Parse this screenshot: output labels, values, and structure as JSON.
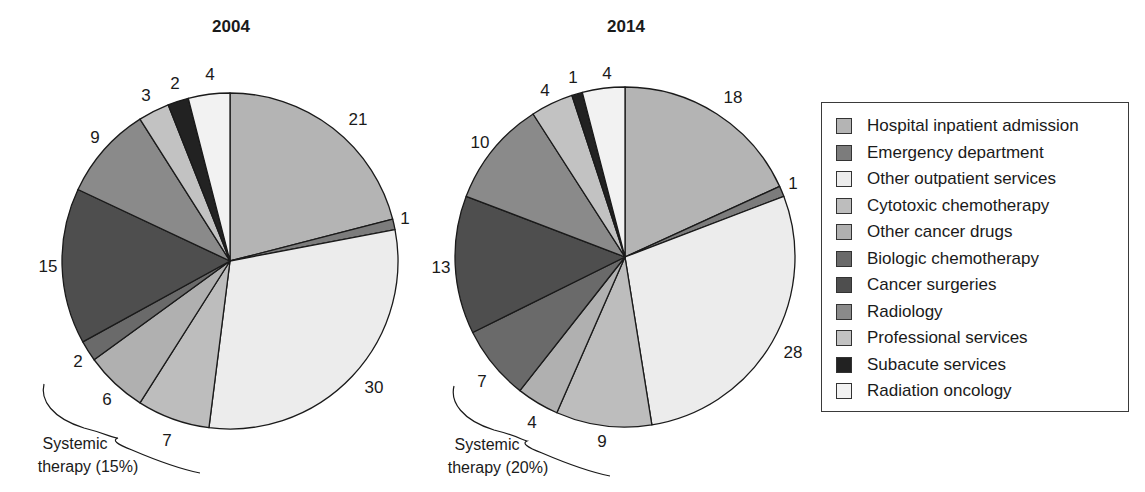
{
  "chart_data": {
    "type": "pie",
    "unit": "%",
    "categories": [
      "Hospital inpatient admission",
      "Emergency department",
      "Other outpatient services",
      "Cytotoxic chemotherapy",
      "Other cancer drugs",
      "Biologic chemotherapy",
      "Cancer surgeries",
      "Radiology",
      "Professional services",
      "Subacute services",
      "Radiation oncology"
    ],
    "colors": [
      "#b4b4b4",
      "#7c7c7c",
      "#ececec",
      "#bdbdbd",
      "#b0b0b0",
      "#6a6a6a",
      "#4e4e4e",
      "#8a8a8a",
      "#c2c2c2",
      "#222222",
      "#f2f2f2"
    ],
    "series": [
      {
        "name": "2004",
        "title": "2004",
        "values": [
          21,
          1,
          30,
          7,
          6,
          2,
          15,
          9,
          3,
          2,
          4
        ],
        "annotation": "Systemic therapy (15%)",
        "annotation_lines": [
          "Systemic",
          "therapy (15%)"
        ],
        "annotation_covers": [
          "Cytotoxic chemotherapy",
          "Other cancer drugs",
          "Biologic chemotherapy"
        ]
      },
      {
        "name": "2014",
        "title": "2014",
        "values": [
          18,
          1,
          28,
          9,
          4,
          7,
          13,
          10,
          4,
          1,
          4
        ],
        "annotation": "Systemic therapy (20%)",
        "annotation_lines": [
          "Systemic",
          "therapy (20%)"
        ],
        "annotation_covers": [
          "Cytotoxic chemotherapy",
          "Other cancer drugs",
          "Biologic chemotherapy"
        ]
      }
    ],
    "start_angle": "12 o'clock",
    "direction": "clockwise",
    "legend_position": "right"
  },
  "pies": [
    {
      "title": "2004",
      "cx": 230,
      "cy": 261,
      "r": 168,
      "title_pos": [
        231,
        32
      ],
      "labels": [
        {
          "text": "21",
          "x": 358,
          "y": 125
        },
        {
          "text": "1",
          "x": 405,
          "y": 224
        },
        {
          "text": "30",
          "x": 374,
          "y": 393
        },
        {
          "text": "7",
          "x": 167,
          "y": 446
        },
        {
          "text": "6",
          "x": 107,
          "y": 405
        },
        {
          "text": "2",
          "x": 78,
          "y": 367
        },
        {
          "text": "15",
          "x": 48,
          "y": 272
        },
        {
          "text": "9",
          "x": 95,
          "y": 143
        },
        {
          "text": "3",
          "x": 146,
          "y": 101
        },
        {
          "text": "2",
          "x": 175,
          "y": 89
        },
        {
          "text": "4",
          "x": 210,
          "y": 80
        }
      ],
      "brace": "M44,384 C40,400 52,418 84,428 C108,434 112,438 118,438 C112,440 116,444 132,450 C160,462 185,470 200,473",
      "annot_pos": [
        [
          75,
          449
        ],
        [
          88,
          472
        ]
      ]
    },
    {
      "title": "2014",
      "cx": 625,
      "cy": 257,
      "r": 170,
      "title_pos": [
        626,
        32
      ],
      "labels": [
        {
          "text": "18",
          "x": 733,
          "y": 103
        },
        {
          "text": "1",
          "x": 793,
          "y": 189
        },
        {
          "text": "28",
          "x": 793,
          "y": 358
        },
        {
          "text": "9",
          "x": 602,
          "y": 447
        },
        {
          "text": "4",
          "x": 532,
          "y": 428
        },
        {
          "text": "7",
          "x": 482,
          "y": 387
        },
        {
          "text": "13",
          "x": 441,
          "y": 273
        },
        {
          "text": "10",
          "x": 480,
          "y": 148
        },
        {
          "text": "4",
          "x": 545,
          "y": 96
        },
        {
          "text": "1",
          "x": 573,
          "y": 83
        },
        {
          "text": "4",
          "x": 607,
          "y": 79
        }
      ],
      "brace": "M454,386 C450,402 462,420 494,430 C518,436 522,440 527,441 C522,443 526,447 542,453 C570,465 595,473 610,476",
      "annot_pos": [
        [
          487,
          450
        ],
        [
          498,
          473
        ]
      ]
    }
  ]
}
